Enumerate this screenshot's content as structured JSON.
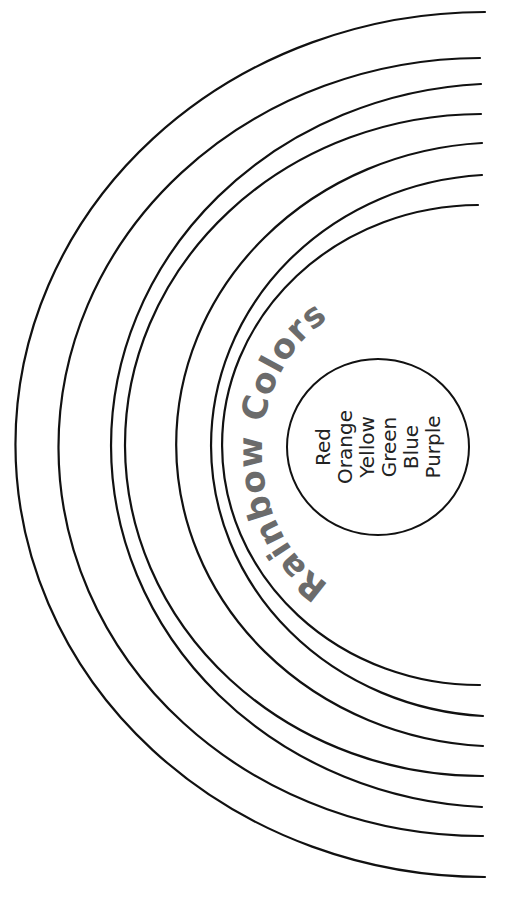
{
  "title": "Rainbow Colors",
  "colors_list": [
    "Red",
    "Orange",
    "Yellow",
    "Green",
    "Blue",
    "Purple"
  ],
  "arcs": [
    {
      "name": "arc-1",
      "top": [
        485,
        12
      ],
      "bottom": [
        485,
        877
      ],
      "left_x": 16
    },
    {
      "name": "arc-2",
      "top": [
        480,
        58
      ],
      "bottom": [
        483,
        836
      ],
      "left_x": 59
    },
    {
      "name": "arc-3",
      "top": [
        481,
        84
      ],
      "bottom": [
        482,
        807
      ],
      "left_x": 90
    },
    {
      "name": "arc-4",
      "top": [
        481,
        114
      ],
      "bottom": [
        483,
        776
      ],
      "left_x": 125
    },
    {
      "name": "arc-5",
      "top": [
        482,
        143
      ],
      "bottom": [
        483,
        746
      ],
      "left_x": 157
    },
    {
      "name": "arc-6",
      "top": [
        482,
        175
      ],
      "bottom": [
        483,
        716
      ],
      "left_x": 193
    },
    {
      "name": "arc-7",
      "top": [
        478,
        205
      ],
      "bottom": [
        480,
        685
      ],
      "left_x": 222
    }
  ],
  "style": {
    "line_color": "#111111",
    "title_color": "#6b6b6b",
    "background": "#ffffff"
  }
}
